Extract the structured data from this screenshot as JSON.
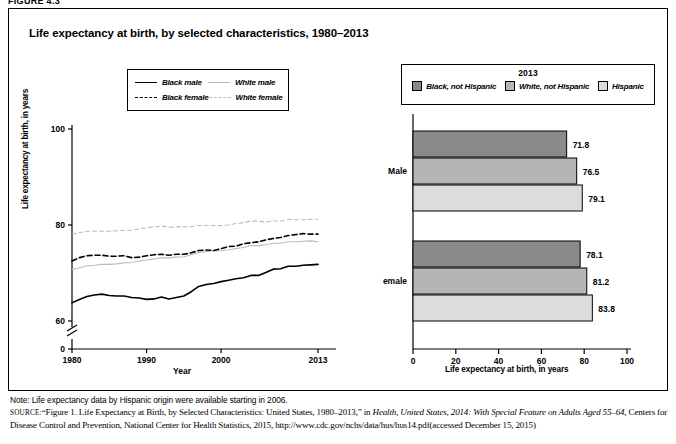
{
  "figure": {
    "tag": "FIGURE 4.3"
  },
  "title": "Life expectancy at birth, by selected characteristics, 1980–2013",
  "line_legend": {
    "items": [
      {
        "label": "Black male",
        "style": "solid-black"
      },
      {
        "label": "White male",
        "style": "solid-gray"
      },
      {
        "label": "Black female",
        "style": "dashed-black"
      },
      {
        "label": "White female",
        "style": "dashed-gray"
      }
    ]
  },
  "bar_legend": {
    "title": "2013",
    "items": [
      {
        "label": "Black, not Hispanic",
        "color": "#8a8a8a"
      },
      {
        "label": "White, not Hispanic",
        "color": "#b5b5b5"
      },
      {
        "label": "Hispanic",
        "color": "#dcdcdc"
      }
    ]
  },
  "note": "Note: Life expectancy data by Hispanic origin were available starting in 2006.",
  "source": {
    "prefix": "SOURCE:",
    "text_1": "“Figure 1. Life Expectancy at Birth, by Selected Characteristics: United States, 1980–2013,” in ",
    "italic_1": "Health, United States, 2014: With Special Feature on Adults Aged 55–64",
    "text_2": ", Centers for Disease Control and Prevention, National Center for Health Statistics, 2015, http://www.cdc.gov/nchs/data/hus/hus14.pdf(accessed December 15, 2015)"
  },
  "chart_data": [
    {
      "type": "line",
      "title": "Life expectancy at birth, by selected characteristics, 1980–2013",
      "xlabel": "Year",
      "ylabel": "Life expectancy at birth, in years",
      "xlim": [
        1980,
        2013
      ],
      "ylim": [
        55,
        100
      ],
      "yticks": [
        0,
        60,
        80,
        100
      ],
      "xticks": [
        1980,
        1990,
        2000,
        2013
      ],
      "axis_break": true,
      "grid": false,
      "legend_position": "top-center",
      "x": [
        1980,
        1981,
        1982,
        1983,
        1984,
        1985,
        1986,
        1987,
        1988,
        1989,
        1990,
        1991,
        1992,
        1993,
        1994,
        1995,
        1996,
        1997,
        1998,
        1999,
        2000,
        2001,
        2002,
        2003,
        2004,
        2005,
        2006,
        2007,
        2008,
        2009,
        2010,
        2011,
        2012,
        2013
      ],
      "series": [
        {
          "name": "Black male",
          "style": "solid-black",
          "values": [
            63.8,
            64.5,
            65.1,
            65.4,
            65.6,
            65.3,
            65.2,
            65.2,
            64.9,
            64.8,
            64.5,
            64.6,
            65.0,
            64.6,
            64.9,
            65.2,
            66.1,
            67.2,
            67.6,
            67.8,
            68.2,
            68.5,
            68.8,
            69.0,
            69.5,
            69.5,
            70.1,
            70.8,
            70.9,
            71.4,
            71.4,
            71.6,
            71.7,
            71.8
          ]
        },
        {
          "name": "White male",
          "style": "solid-gray",
          "values": [
            70.7,
            71.1,
            71.5,
            71.6,
            71.8,
            71.8,
            71.9,
            72.1,
            72.2,
            72.5,
            72.7,
            72.9,
            73.2,
            73.1,
            73.3,
            73.4,
            73.8,
            74.3,
            74.5,
            74.6,
            74.7,
            74.8,
            75.1,
            75.3,
            75.7,
            75.7,
            75.9,
            76.2,
            76.2,
            76.5,
            76.5,
            76.6,
            76.7,
            76.5
          ]
        },
        {
          "name": "Black female",
          "style": "dashed-black",
          "values": [
            72.5,
            73.2,
            73.6,
            73.7,
            73.7,
            73.5,
            73.5,
            73.6,
            73.2,
            73.3,
            73.6,
            73.8,
            73.9,
            73.7,
            73.9,
            73.9,
            74.2,
            74.7,
            74.8,
            74.7,
            75.1,
            75.5,
            75.6,
            76.1,
            76.3,
            76.5,
            76.9,
            77.2,
            77.4,
            77.8,
            78.0,
            78.2,
            78.1,
            78.1
          ]
        },
        {
          "name": "White female",
          "style": "dashed-gray",
          "values": [
            78.1,
            78.4,
            78.7,
            78.7,
            78.7,
            78.7,
            78.8,
            78.9,
            78.9,
            79.2,
            79.4,
            79.6,
            79.8,
            79.5,
            79.6,
            79.6,
            79.7,
            79.9,
            79.9,
            79.9,
            79.9,
            80.0,
            80.3,
            80.5,
            80.8,
            80.8,
            80.6,
            80.9,
            80.8,
            81.2,
            81.1,
            81.1,
            81.2,
            81.2
          ]
        }
      ]
    },
    {
      "type": "bar",
      "orientation": "horizontal",
      "title": "2013",
      "xlabel": "Life expectancy at birth, in years",
      "ylabel": "",
      "xlim": [
        0,
        100
      ],
      "xticks": [
        0,
        20,
        40,
        60,
        80,
        100
      ],
      "categories": [
        "Male",
        "Female"
      ],
      "grid": false,
      "legend_position": "top-center",
      "series": [
        {
          "name": "Black, not Hispanic",
          "color": "#8a8a8a",
          "values": [
            71.8,
            78.1
          ]
        },
        {
          "name": "White, not Hispanic",
          "color": "#b5b5b5",
          "values": [
            76.5,
            81.2
          ]
        },
        {
          "name": "Hispanic",
          "color": "#dcdcdc",
          "values": [
            79.1,
            83.8
          ]
        }
      ],
      "data_labels": [
        "71.8",
        "76.5",
        "79.1",
        "78.1",
        "81.2",
        "83.8"
      ]
    }
  ]
}
